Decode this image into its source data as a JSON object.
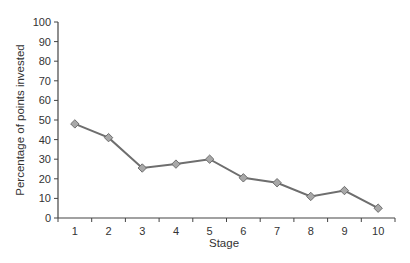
{
  "chart_data": {
    "type": "line",
    "title": "",
    "xlabel": "Stage",
    "ylabel": "Percentage of points invested",
    "categories": [
      "1",
      "2",
      "3",
      "4",
      "5",
      "6",
      "7",
      "8",
      "9",
      "10"
    ],
    "values": [
      48,
      41,
      25.5,
      27.5,
      30,
      20.5,
      18,
      11,
      14,
      5
    ],
    "ylim": [
      0,
      100
    ],
    "yticks": [
      0,
      10,
      20,
      30,
      40,
      50,
      60,
      70,
      80,
      90,
      100
    ],
    "grid": false,
    "legend": null,
    "marker": "diamond",
    "colors": {
      "line": "#6e6e6e",
      "marker_fill": "#a8a8a8",
      "marker_stroke": "#6e6e6e",
      "axis": "#444444",
      "text": "#333333"
    }
  }
}
